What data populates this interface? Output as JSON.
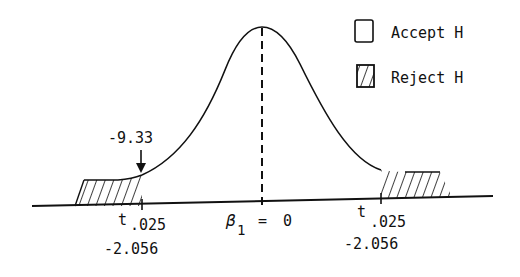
{
  "legend": {
    "accept_label": "Accept H",
    "reject_label": "Reject H"
  },
  "annotations": {
    "observed_value": "-9.33",
    "left_critical": {
      "symbol": "t",
      "subscript": ".025",
      "value": "-2.056"
    },
    "right_critical": {
      "symbol": "t",
      "subscript": ".025",
      "value": "-2.056"
    },
    "center": {
      "symbol": "β",
      "subscript": "1",
      "equals": "=",
      "value": "0"
    }
  },
  "colors": {
    "ink": "#111111",
    "background": "#ffffff"
  }
}
